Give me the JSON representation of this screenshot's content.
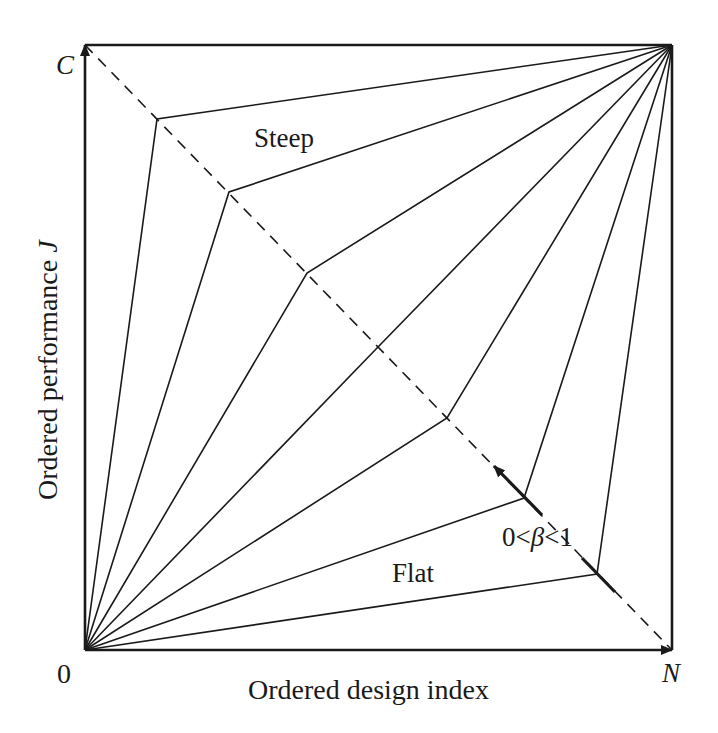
{
  "diagram": {
    "title": "",
    "colors": {
      "stroke": "#1a1a1a",
      "background": "#ffffff"
    },
    "axes": {
      "x_label": "Ordered design index",
      "y_label_prefix": "Ordered performance ",
      "y_label_var": "J",
      "origin_label": "0",
      "x_end_label": "N",
      "y_end_label": "C"
    },
    "annotations": {
      "steep": "Steep",
      "flat": "Flat",
      "beta_prefix": "0<",
      "beta_symbol": "β",
      "beta_suffix": "<1"
    },
    "frame": {
      "x0": 85,
      "y0": 45,
      "x1": 672,
      "y1": 650
    },
    "diagonal": {
      "from": [
        85,
        45
      ],
      "to": [
        672,
        650
      ],
      "style": "dashed"
    },
    "curve_vertices": [
      [
        157,
        119
      ],
      [
        229,
        192
      ],
      [
        307,
        273
      ],
      [
        378,
        347
      ],
      [
        447,
        418
      ],
      [
        524,
        498
      ],
      [
        597,
        574
      ]
    ],
    "beta_arrow": {
      "from": [
        542,
        515
      ],
      "to": [
        494,
        466
      ]
    },
    "beta_tick": {
      "from": [
        582,
        558
      ],
      "to": [
        615,
        592
      ]
    }
  }
}
